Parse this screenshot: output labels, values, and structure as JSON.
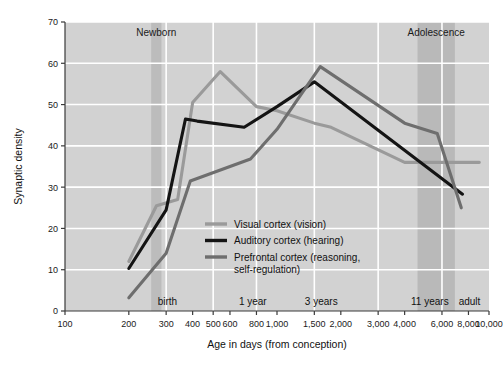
{
  "chart_data": {
    "type": "line",
    "title": "",
    "xlabel": "Age in days (from conception)",
    "ylabel": "Synaptic density",
    "xscale": "log",
    "xlim": [
      100,
      10000
    ],
    "ylim": [
      0,
      70
    ],
    "yticks": [
      0,
      10,
      20,
      30,
      40,
      50,
      60,
      70
    ],
    "xticks": [
      100,
      200,
      300,
      400,
      500,
      600,
      800,
      1000,
      1500,
      2000,
      3000,
      4000,
      6000,
      8000,
      10000
    ],
    "xtick_labels": [
      "100",
      "200",
      "300",
      "400",
      "500",
      "600",
      "800",
      "1,000",
      "1,500",
      "2,000",
      "3,000",
      "4,000",
      "6,000",
      "8,000",
      "10,000"
    ],
    "grid": true,
    "gridlines_x": [
      300,
      500,
      800,
      1500,
      3000,
      6000
    ],
    "legend_position": "center",
    "series": [
      {
        "name": "Visual cortex (vision)",
        "color": "#9a9a9a",
        "points": [
          {
            "x": 200,
            "y": 12
          },
          {
            "x": 270,
            "y": 25.5
          },
          {
            "x": 340,
            "y": 27
          },
          {
            "x": 400,
            "y": 50.5
          },
          {
            "x": 540,
            "y": 58
          },
          {
            "x": 800,
            "y": 49.5
          },
          {
            "x": 1000,
            "y": 48.5
          },
          {
            "x": 1500,
            "y": 45.5
          },
          {
            "x": 1800,
            "y": 44.5
          },
          {
            "x": 4000,
            "y": 36
          },
          {
            "x": 9000,
            "y": 36
          }
        ]
      },
      {
        "name": "Auditory cortex (hearing)",
        "color": "#141414",
        "points": [
          {
            "x": 200,
            "y": 10.3
          },
          {
            "x": 300,
            "y": 24.5
          },
          {
            "x": 370,
            "y": 46.5
          },
          {
            "x": 420,
            "y": 46
          },
          {
            "x": 700,
            "y": 44.5
          },
          {
            "x": 1000,
            "y": 49.5
          },
          {
            "x": 1500,
            "y": 55.5
          },
          {
            "x": 7500,
            "y": 28.3
          }
        ]
      },
      {
        "name": "Prefrontal cortex (reasoning, self-regulation)",
        "color": "#6e6e6e",
        "points": [
          {
            "x": 200,
            "y": 3.2
          },
          {
            "x": 300,
            "y": 14
          },
          {
            "x": 390,
            "y": 31.5
          },
          {
            "x": 750,
            "y": 36.8
          },
          {
            "x": 1000,
            "y": 44
          },
          {
            "x": 1600,
            "y": 59.2
          },
          {
            "x": 4000,
            "y": 45.5
          },
          {
            "x": 5700,
            "y": 43
          },
          {
            "x": 7400,
            "y": 25
          }
        ]
      }
    ],
    "bands": [
      {
        "label": "Newborn",
        "x_start": 255,
        "x_end": 285,
        "color": "#b4b4b4"
      },
      {
        "label": "Adolescence",
        "x_start": 4600,
        "x_end": 6900,
        "color": "#b0b0b0"
      }
    ],
    "era_markers": [
      {
        "label": "birth",
        "x": 265
      },
      {
        "label": "1 year",
        "x": 640
      },
      {
        "label": "3 years",
        "x": 1310
      },
      {
        "label": "11 years",
        "x": 4150
      },
      {
        "label": "adult",
        "x": 9300
      }
    ],
    "annotations": []
  }
}
